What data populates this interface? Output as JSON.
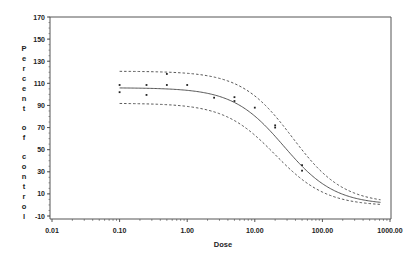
{
  "chart_data": {
    "type": "scatter",
    "title": "",
    "xlabel": "Dose",
    "ylabel": "Percent of control",
    "xscale": "log",
    "xlim": [
      0.01,
      1000
    ],
    "ylim": [
      -10,
      170
    ],
    "x_ticks": [
      "0.01",
      "0.10",
      "1.00",
      "10.00",
      "100.00",
      "1000.00"
    ],
    "x_tick_values": [
      0.01,
      0.1,
      1,
      10,
      100,
      1000
    ],
    "y_ticks": [
      "170",
      "150",
      "130",
      "110",
      "90",
      "70",
      "50",
      "30",
      "10",
      "-10"
    ],
    "y_tick_values": [
      170,
      150,
      130,
      110,
      90,
      70,
      50,
      30,
      10,
      -10
    ],
    "grid": false,
    "legend": null,
    "series": [
      {
        "name": "Observed",
        "kind": "points",
        "x": [
          0.1,
          0.1,
          0.25,
          0.25,
          0.5,
          0.5,
          1.0,
          2.5,
          5.0,
          5.0,
          10.0,
          20.0,
          20.0,
          50.0,
          50.0
        ],
        "y": [
          108.5,
          102,
          108.5,
          99.5,
          118.5,
          108.5,
          108.5,
          97,
          97.5,
          94,
          88,
          72,
          70,
          36,
          31
        ]
      },
      {
        "name": "Fitted curve",
        "kind": "line",
        "style": "solid",
        "params": {
          "top": 106,
          "bottom": 0,
          "ec50": 27,
          "hill": 1.15
        }
      },
      {
        "name": "Upper confidence band",
        "kind": "line",
        "style": "dashed",
        "params": {
          "top": 121,
          "bottom": 1,
          "ec50": 36,
          "hill": 1.15
        }
      },
      {
        "name": "Lower confidence band",
        "kind": "line",
        "style": "dashed",
        "params": {
          "top": 92,
          "bottom": -1,
          "ec50": 20,
          "hill": 1.15
        }
      }
    ]
  },
  "colors": {
    "axis": "#555555",
    "curve": "#444444",
    "points": "#222222",
    "text": "#222222"
  }
}
